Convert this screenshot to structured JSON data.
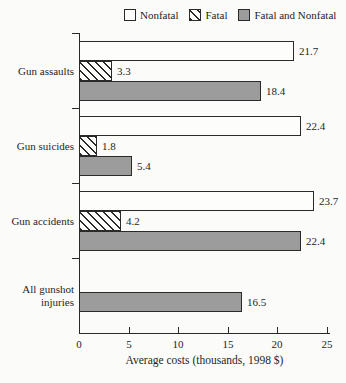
{
  "chart_data": {
    "type": "bar",
    "orientation": "horizontal",
    "xlabel": "Average costs (thousands, 1998 $)",
    "xlim": [
      0,
      25
    ],
    "xticks": [
      0,
      5,
      10,
      15,
      20,
      25
    ],
    "grid": false,
    "legend_position": "top",
    "value_labels": true,
    "categories": [
      "Gun assaults",
      "Gun suicides",
      "Gun accidents",
      "All gunshot injuries"
    ],
    "series": [
      {
        "name": "Nonfatal",
        "style": "white",
        "values": [
          21.7,
          22.4,
          23.7,
          null
        ]
      },
      {
        "name": "Fatal",
        "style": "hatched",
        "values": [
          3.3,
          1.8,
          4.2,
          null
        ]
      },
      {
        "name": "Fatal and Nonfatal",
        "style": "gray",
        "values": [
          18.4,
          5.4,
          22.4,
          16.5
        ]
      }
    ]
  },
  "colors": {
    "bar_gray": "#9c9c9c",
    "bar_white": "#fdfdfc",
    "hatch_line": "#2a2a2a",
    "bar_border": "#2a2a2a",
    "axis": "#2a2a2a",
    "background": "#fbfbf9",
    "text": "#1f1f1f"
  }
}
